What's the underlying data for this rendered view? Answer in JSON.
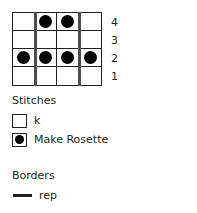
{
  "chart_data": {
    "type": "table",
    "title": "",
    "columns": 4,
    "rows": 4,
    "row_labels": [
      "4",
      "3",
      "2",
      "1"
    ],
    "grid": [
      {
        "row_label": "4",
        "cells": [
          "k",
          "Make Rosette",
          "Make Rosette",
          "k"
        ]
      },
      {
        "row_label": "3",
        "cells": [
          "k",
          "k",
          "k",
          "k"
        ]
      },
      {
        "row_label": "2",
        "cells": [
          "Make Rosette",
          "Make Rosette",
          "Make Rosette",
          "Make Rosette"
        ]
      },
      {
        "row_label": "1",
        "cells": [
          "k",
          "k",
          "k",
          "k"
        ]
      }
    ],
    "repeat_border_columns": [
      1,
      3
    ],
    "symbols": {
      "k": "empty-square",
      "Make Rosette": "filled-dot-square"
    }
  },
  "stitches": {
    "heading": "Stitches",
    "items": [
      {
        "symbol": "empty-square",
        "label": "k"
      },
      {
        "symbol": "filled-dot-square",
        "label": "Make Rosette"
      }
    ]
  },
  "borders": {
    "heading": "Borders",
    "items": [
      {
        "symbol": "thick-line",
        "label": "rep"
      }
    ]
  },
  "colors": {
    "ink": "#231f20",
    "dot": "#000000",
    "grid_line": "#231f20",
    "repeat_line": "#4d4d4d",
    "background": "#ffffff"
  }
}
